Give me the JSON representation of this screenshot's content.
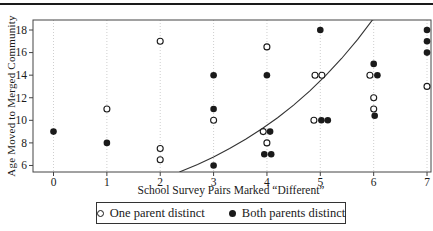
{
  "figure": {
    "background": "#ffffff",
    "top_rule_color": "#1a1a1a",
    "text_color": "#1a1a1a",
    "gridline_color": "#c9c9c9",
    "axis_color": "#444444"
  },
  "chart_data": {
    "type": "scatter",
    "title": "",
    "xlabel": "School Survey Pairs Marked “Different”",
    "ylabel": "Age Moved to Merged Community",
    "x_ticks": [
      0,
      1,
      2,
      3,
      4,
      5,
      6,
      7
    ],
    "y_ticks": [
      6,
      8,
      10,
      12,
      14,
      16,
      18
    ],
    "xlim": [
      -0.38,
      7.08
    ],
    "ylim": [
      5.4,
      18.9
    ],
    "grid": "vertical-dotted",
    "legend_position": "bottom",
    "series": [
      {
        "name": "One parent distinct",
        "marker": "open-circle",
        "color": "#1a1a1a",
        "points": [
          [
            1,
            11
          ],
          [
            2,
            17
          ],
          [
            2,
            7.5
          ],
          [
            2,
            6.5
          ],
          [
            3,
            10
          ],
          [
            3.93,
            9
          ],
          [
            4,
            16.5
          ],
          [
            4,
            8
          ],
          [
            4.9,
            14
          ],
          [
            5.03,
            14
          ],
          [
            4.88,
            10
          ],
          [
            5.93,
            14
          ],
          [
            6,
            12
          ],
          [
            6,
            11
          ],
          [
            7,
            13
          ]
        ]
      },
      {
        "name": "Both parents distinct",
        "marker": "filled-circle",
        "color": "#1a1a1a",
        "points": [
          [
            0,
            9
          ],
          [
            1,
            8
          ],
          [
            3,
            14
          ],
          [
            3,
            11
          ],
          [
            3,
            6
          ],
          [
            4,
            14
          ],
          [
            4.06,
            9
          ],
          [
            3.95,
            7
          ],
          [
            4.08,
            7
          ],
          [
            5,
            18
          ],
          [
            5.02,
            10
          ],
          [
            5.14,
            10
          ],
          [
            6,
            15
          ],
          [
            6.07,
            14
          ],
          [
            6.02,
            10.4
          ],
          [
            7,
            18
          ],
          [
            7,
            17
          ],
          [
            7,
            16
          ]
        ]
      }
    ],
    "trend_curve": {
      "shape": "exponential",
      "points": [
        [
          2.36,
          5.42
        ],
        [
          2.7,
          6.1
        ],
        [
          3.0,
          6.76
        ],
        [
          3.3,
          7.5
        ],
        [
          3.6,
          8.32
        ],
        [
          3.9,
          9.23
        ],
        [
          4.2,
          10.23
        ],
        [
          4.5,
          11.35
        ],
        [
          4.8,
          12.59
        ],
        [
          5.1,
          13.96
        ],
        [
          5.4,
          15.48
        ],
        [
          5.7,
          17.17
        ],
        [
          6.0,
          19.04
        ]
      ]
    }
  },
  "legend": {
    "entries": [
      {
        "icon": "open-circle-icon",
        "label": "One parent distinct"
      },
      {
        "icon": "filled-circle-icon",
        "label": "Both parents distinct"
      }
    ]
  }
}
